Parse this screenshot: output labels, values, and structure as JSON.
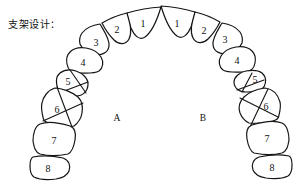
{
  "title": "支架设计：",
  "sides": {
    "left_label": "A",
    "right_label": "B"
  },
  "teeth": {
    "left": [
      {
        "label": "1",
        "crossed": false
      },
      {
        "label": "2",
        "crossed": false
      },
      {
        "label": "3",
        "crossed": false
      },
      {
        "label": "4",
        "crossed": false
      },
      {
        "label": "5",
        "crossed": true
      },
      {
        "label": "6",
        "crossed": true
      },
      {
        "label": "7",
        "crossed": false
      },
      {
        "label": "8",
        "crossed": false
      }
    ],
    "right": [
      {
        "label": "1",
        "crossed": false
      },
      {
        "label": "2",
        "crossed": false
      },
      {
        "label": "3",
        "crossed": false
      },
      {
        "label": "4",
        "crossed": false
      },
      {
        "label": "5",
        "crossed": true
      },
      {
        "label": "6",
        "crossed": true
      },
      {
        "label": "7",
        "crossed": false
      },
      {
        "label": "8",
        "crossed": false
      }
    ]
  },
  "colors": {
    "stroke": "#151515",
    "background": "#ffffff"
  }
}
